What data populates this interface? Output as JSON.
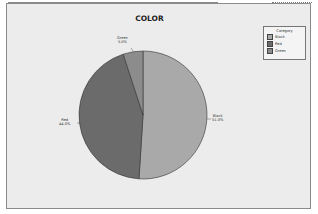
{
  "chart_data": {
    "type": "pie",
    "title": "COLOR",
    "categories": [
      "Black",
      "Red",
      "Green"
    ],
    "values": [
      51.0,
      44.0,
      5.0
    ],
    "labels": [
      "Black\n51.0%",
      "Red\n44.0%",
      "Green\n5.0%"
    ],
    "colors": [
      "#a9a9a9",
      "#6b6b6b",
      "#8c8c8c"
    ],
    "legend": {
      "title": "Category",
      "position": "right",
      "entries": [
        "Black",
        "Red",
        "Green"
      ]
    }
  },
  "title": "COLOR",
  "labels": {
    "black_name": "Black",
    "black_pct": "51.0%",
    "red_name": "Red",
    "red_pct": "44.0%",
    "green_name": "Green",
    "green_pct": "5.0%"
  },
  "legend": {
    "title": "Category",
    "items": [
      {
        "label": "Black",
        "color": "#a9a9a9"
      },
      {
        "label": "Red",
        "color": "#6b6b6b"
      },
      {
        "label": "Green",
        "color": "#8c8c8c"
      }
    ]
  }
}
